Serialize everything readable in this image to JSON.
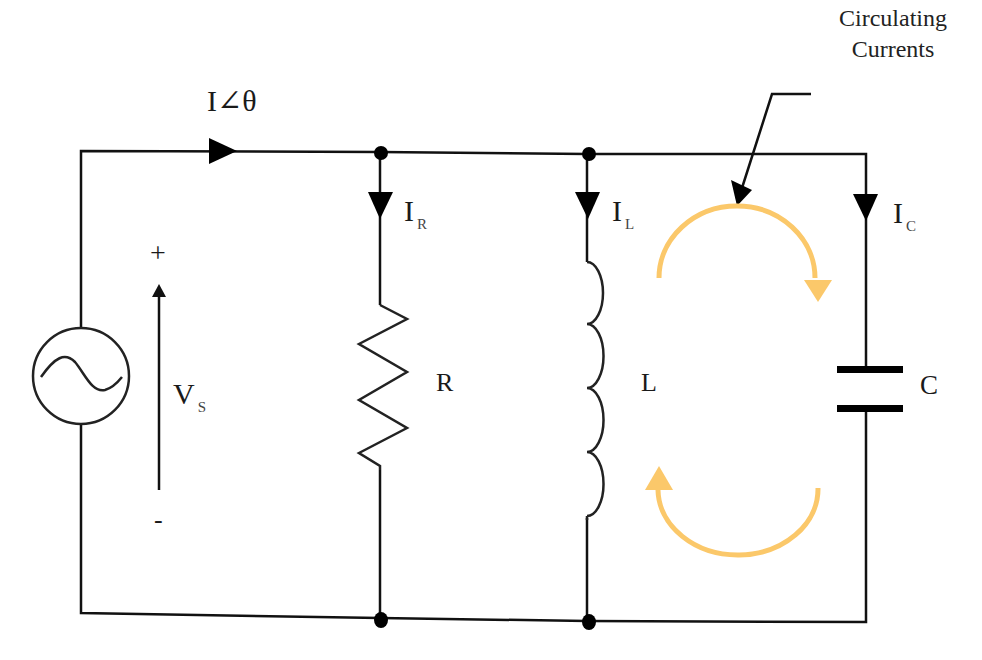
{
  "diagram": {
    "source": {
      "type": "AC voltage source",
      "icon": "sine-wave-icon",
      "label_main": "V",
      "label_sub": "S",
      "plus": "+",
      "minus": "-"
    },
    "total_current": {
      "label": "I∠θ"
    },
    "branches": [
      {
        "component": "resistor",
        "label": "R",
        "current_main": "I",
        "current_sub": "R"
      },
      {
        "component": "inductor",
        "label": "L",
        "current_main": "I",
        "current_sub": "L"
      },
      {
        "component": "capacitor",
        "label": "C",
        "current_main": "I",
        "current_sub": "C"
      }
    ],
    "callout": {
      "line1": "Circulating",
      "line2": "Currents"
    },
    "colors": {
      "wire": "#111111",
      "circulating_arrow": "#FBC86A",
      "background": "#FFFFFF"
    }
  }
}
